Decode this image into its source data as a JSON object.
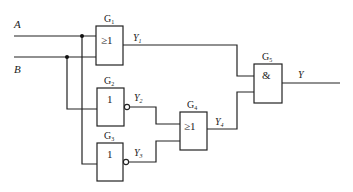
{
  "inputs": [
    {
      "name": "A",
      "label": "A"
    },
    {
      "name": "B",
      "label": "B"
    }
  ],
  "gates": [
    {
      "id": "G1",
      "name": "G",
      "sub": "1",
      "symbol": "≥1",
      "output": {
        "name": "Y",
        "sub": "1"
      }
    },
    {
      "id": "G2",
      "name": "G",
      "sub": "2",
      "symbol": "1",
      "output": {
        "name": "Y",
        "sub": "2"
      }
    },
    {
      "id": "G3",
      "name": "G",
      "sub": "3",
      "symbol": "1",
      "output": {
        "name": "Y",
        "sub": "3"
      }
    },
    {
      "id": "G4",
      "name": "G",
      "sub": "4",
      "symbol": "≥1",
      "output": {
        "name": "Y",
        "sub": "4"
      }
    },
    {
      "id": "G5",
      "name": "G",
      "sub": "5",
      "symbol": "&",
      "output": {
        "name": "Y",
        "sub": ""
      }
    }
  ],
  "output": {
    "label": "Y"
  }
}
